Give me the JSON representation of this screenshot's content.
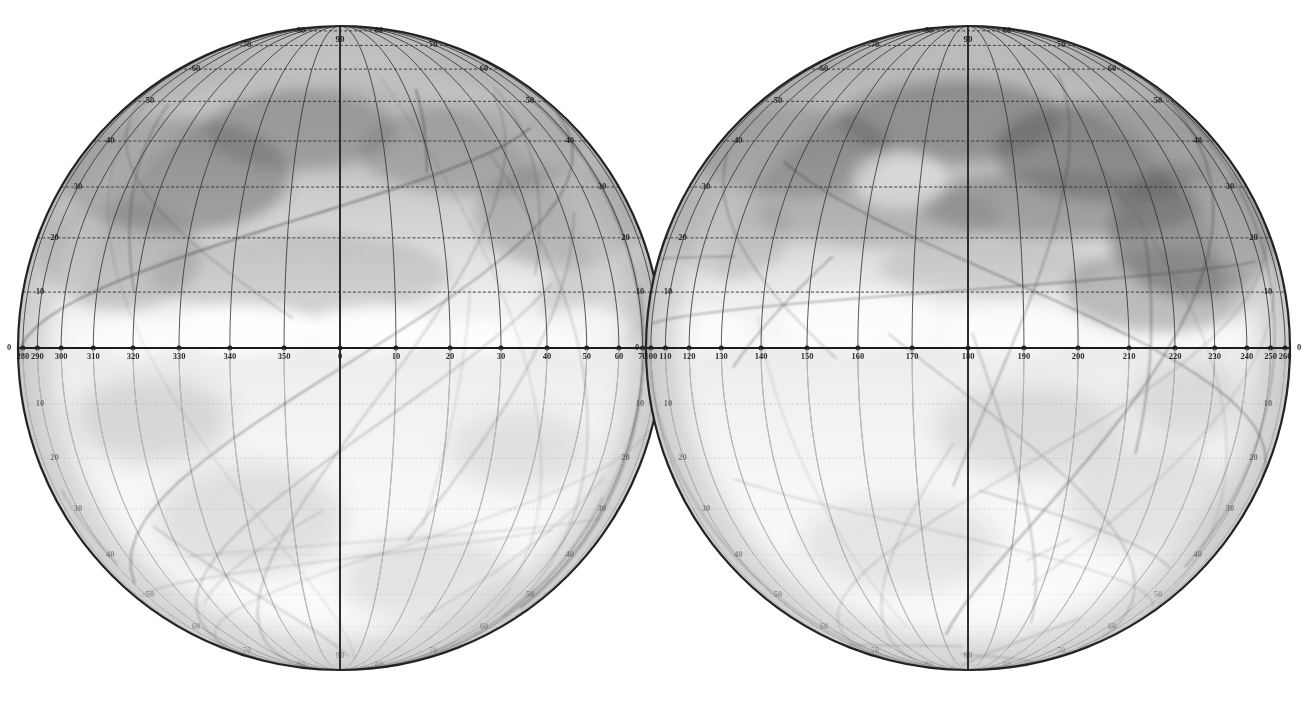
{
  "figure": {
    "kind": "astronomical-map",
    "projection": "orthographic",
    "background_color": "#ffffff",
    "ink_color": "#2b2b2b"
  },
  "chart_data": {
    "type": "scatter",
    "title": "",
    "xlabel": "",
    "ylabel": "",
    "grid": true,
    "legend": null,
    "hemispheres": [
      {
        "name": "left-hemisphere",
        "center_x": 340,
        "center_y": 348,
        "radius": 322,
        "center_longitude": 0,
        "equator_longitude_labels": [
          "280",
          "290",
          "300",
          "310",
          "320",
          "330",
          "340",
          "350",
          "0",
          "10",
          "20",
          "30",
          "40",
          "50",
          "60",
          "70",
          "80",
          "90"
        ],
        "equator_longitude_values": [
          280,
          290,
          300,
          310,
          320,
          330,
          340,
          350,
          0,
          10,
          20,
          30,
          40,
          50,
          60,
          70,
          80,
          90
        ],
        "left_edge_latitude_labels_north": [
          "50",
          "40",
          "30",
          "20",
          "10",
          "0"
        ],
        "left_edge_latitude_labels_south": [
          "10",
          "20",
          "30",
          "40",
          "50",
          "60",
          "70",
          "80"
        ],
        "right_edge_latitude_labels_north": [
          "60",
          "50",
          "40",
          "30",
          "20",
          "10",
          "0"
        ],
        "right_edge_latitude_labels_south": [
          "10",
          "20",
          "30",
          "40",
          "50",
          "60",
          "70",
          "80"
        ],
        "rim_latitude_labels_north": [
          "80",
          "70",
          "60"
        ],
        "north_pole_label": "90",
        "south_pole_label": "90"
      },
      {
        "name": "right-hemisphere",
        "center_x": 968,
        "center_y": 348,
        "radius": 322,
        "center_longitude": 180,
        "equator_longitude_labels": [
          "90",
          "100",
          "110",
          "120",
          "130",
          "140",
          "150",
          "160",
          "170",
          "180",
          "190",
          "200",
          "210",
          "220",
          "230",
          "240",
          "250",
          "260",
          "0"
        ],
        "equator_longitude_values": [
          90,
          100,
          110,
          120,
          130,
          140,
          150,
          160,
          170,
          180,
          190,
          200,
          210,
          220,
          230,
          240,
          250,
          260,
          0
        ],
        "left_edge_latitude_labels_north": [
          "30",
          "20",
          "10"
        ],
        "left_edge_latitude_labels_south": [
          "20",
          "30",
          "40",
          "50"
        ],
        "right_edge_latitude_labels_north": [
          "60",
          "50",
          "40",
          "30",
          "20",
          "10",
          "0"
        ],
        "right_edge_latitude_labels_south": [
          "10",
          "20",
          "30",
          "40",
          "50",
          "60",
          "70",
          "80"
        ],
        "rim_latitude_labels_north": [
          "80",
          "70",
          "60"
        ],
        "north_pole_label": "90",
        "south_pole_label": "90"
      }
    ],
    "graticule": {
      "latitude_step_deg": 10,
      "longitude_step_deg": 10,
      "latitude_ticks": [
        -80,
        -70,
        -60,
        -50,
        -40,
        -30,
        -20,
        -10,
        0,
        10,
        20,
        30,
        40,
        50,
        60,
        70,
        80
      ],
      "longitude_ticks": [
        0,
        10,
        20,
        30,
        40,
        50,
        60,
        70,
        80,
        90,
        100,
        110,
        120,
        130,
        140,
        150,
        160,
        170,
        180,
        190,
        200,
        210,
        220,
        230,
        240,
        250,
        260,
        270,
        280,
        290,
        300,
        310,
        320,
        330,
        340,
        350
      ],
      "equator_emphasized": true
    },
    "shading": {
      "north_dark_band_note": "broad dusky albedo region north of the equator, darkest near 30-70 deg N",
      "south_light_note": "southern hemisphere rendered very pale / nearly blank",
      "polar_cap_note": "light rim cap near the north limb"
    },
    "canals": {
      "count_visible": 46,
      "note": "network of fine straight lineaments (canali) crossing both hemispheres, denser in the right hemisphere"
    }
  }
}
